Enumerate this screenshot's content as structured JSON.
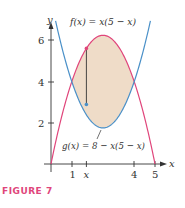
{
  "figure": {
    "caption": "FIGURE 7"
  },
  "labels": {
    "f": "f(x) = x(5 − x)",
    "g": "g(x) = 8 − x(5 − x)",
    "x_axis": "x",
    "y_axis": "y",
    "xticks": [
      "1",
      "x",
      "4",
      "5"
    ],
    "yticks": [
      "2",
      "4",
      "6"
    ]
  },
  "colors": {
    "f_curve": "#E0457B",
    "g_curve": "#4A90C8",
    "fill": "#EFDCC8",
    "axis": "#333333"
  },
  "chart_data": {
    "type": "line",
    "title": "",
    "xlabel": "x",
    "ylabel": "y",
    "xlim": [
      0,
      5.3
    ],
    "ylim": [
      0,
      6.5
    ],
    "xticks": [
      1,
      4,
      5
    ],
    "xtick_labels_extra": [
      {
        "value": 1.7,
        "label": "x"
      }
    ],
    "yticks": [
      2,
      4,
      6
    ],
    "grid": false,
    "legend": "inline labels",
    "series": [
      {
        "name": "f(x) = x(5 − x)",
        "color": "#E0457B",
        "x": [
          0,
          0.5,
          1,
          1.5,
          2,
          2.5,
          3,
          3.5,
          4,
          4.5,
          5
        ],
        "y": [
          0,
          2.25,
          4,
          5.25,
          6,
          6.25,
          6,
          5.25,
          4,
          2.25,
          0
        ]
      },
      {
        "name": "g(x) = 8 − x(5 − x)",
        "color": "#4A90C8",
        "x": [
          0.25,
          0.5,
          1,
          1.5,
          2,
          2.5,
          3,
          3.5,
          4,
          4.5,
          4.75
        ],
        "y": [
          6.81,
          5.75,
          4,
          2.75,
          2,
          1.75,
          2,
          2.75,
          4,
          5.75,
          6.81
        ]
      }
    ],
    "shaded_region": {
      "between": [
        "f",
        "g"
      ],
      "x_range": [
        1,
        4
      ],
      "color": "#EFDCC8"
    },
    "intersections": [
      [
        1,
        4
      ],
      [
        4,
        4
      ]
    ],
    "annotations": [
      {
        "type": "vertical_segment",
        "x": 1.7,
        "y_top": 5.61,
        "y_bottom": 2.89,
        "description": "representative strip from g(x) to f(x)"
      }
    ]
  }
}
